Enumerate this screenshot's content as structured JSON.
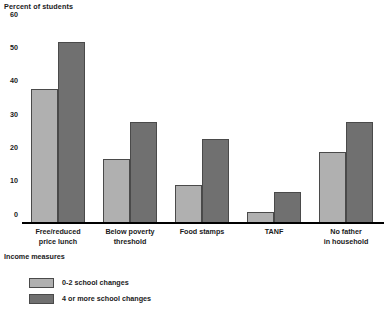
{
  "chart_data": {
    "type": "bar",
    "title": "",
    "xlabel": "Income measures",
    "ylabel": "Percent of students",
    "ylim": [
      0,
      60
    ],
    "yticks": [
      0,
      10,
      20,
      30,
      40,
      50,
      60
    ],
    "grid": false,
    "legend_position": "bottom-left",
    "categories": [
      "Free/reduced\nprice lunch",
      "Below poverty\nthreshold",
      "Food stamps",
      "TANF",
      "No father\nin household"
    ],
    "series": [
      {
        "name": "0-2 school changes",
        "color": "#b0b0b0",
        "values": [
          40,
          19,
          11,
          3,
          21
        ]
      },
      {
        "name": "4 or more school changes",
        "color": "#707070",
        "values": [
          54,
          30,
          25,
          9,
          30
        ]
      }
    ]
  },
  "colors": {
    "series_light": "#b0b0b0",
    "series_dark": "#707070",
    "axis": "#000000",
    "text": "#1a1a1a"
  }
}
